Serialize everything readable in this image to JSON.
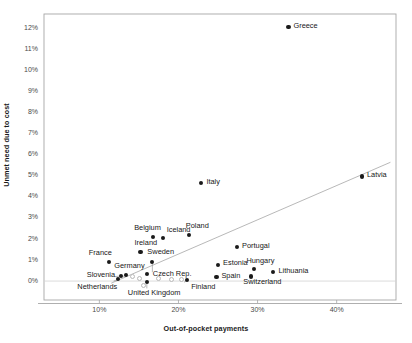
{
  "chart_data": {
    "type": "scatter",
    "title": "",
    "xlabel": "Out-of-pocket payments",
    "ylabel": "Unmet need due to cost",
    "xlim": [
      0.03,
      0.475
    ],
    "ylim": [
      -0.009,
      0.127
    ],
    "xticks": [
      "10%",
      "20%",
      "30%",
      "40%"
    ],
    "xtick_values": [
      0.1,
      0.2,
      0.3,
      0.4
    ],
    "yticks": [
      "0%",
      "1%",
      "2%",
      "3%",
      "4%",
      "5%",
      "6%",
      "7%",
      "8%",
      "9%",
      "10%",
      "11%",
      "12%"
    ],
    "ytick_values": [
      0.0,
      0.01,
      0.02,
      0.03,
      0.04,
      0.05,
      0.06,
      0.07,
      0.08,
      0.09,
      0.1,
      0.11,
      0.12
    ],
    "grid": false,
    "legend": "none",
    "zero_line": true,
    "trendline": {
      "label": "linear trend",
      "x_start": 0.115,
      "y_start": -0.001,
      "x_end": 0.468,
      "y_end": 0.0565
    },
    "points": [
      {
        "label": "Greece",
        "x": 0.339,
        "y": 0.1207,
        "label_dx": 5,
        "label_dy": -3.2,
        "marker": "filled"
      },
      {
        "label": "Latvia",
        "x": 0.432,
        "y": 0.0497,
        "label_dx": 5,
        "label_dy": -3.2,
        "marker": "filled"
      },
      {
        "label": "Italy",
        "x": 0.229,
        "y": 0.0466,
        "label_dx": 5,
        "label_dy": -3.2,
        "marker": "filled"
      },
      {
        "label": "Poland",
        "x": 0.213,
        "y": 0.0218,
        "label_dx": -3,
        "label_dy": -11,
        "marker": "filled"
      },
      {
        "label": "Belgium",
        "x": 0.168,
        "y": 0.0208,
        "label_dx": -19,
        "label_dy": -11,
        "marker": "filled"
      },
      {
        "label": "Iceland",
        "x": 0.18,
        "y": 0.0205,
        "label_dx": 4,
        "label_dy": -10,
        "marker": "filled"
      },
      {
        "label": "Portugal",
        "x": 0.274,
        "y": 0.0162,
        "label_dx": 5,
        "label_dy": -3.2,
        "marker": "filled"
      },
      {
        "label": "Ireland",
        "x": 0.152,
        "y": 0.0137,
        "label_dx": -6,
        "label_dy": -11,
        "marker": "filled"
      },
      {
        "label": "France",
        "x": 0.112,
        "y": 0.009,
        "label_dx": -20,
        "label_dy": -11,
        "marker": "filled"
      },
      {
        "label": "Sweden",
        "x": 0.167,
        "y": 0.0091,
        "label_dx": -5,
        "label_dy": -12,
        "marker": "filled"
      },
      {
        "label": "Estonia",
        "x": 0.25,
        "y": 0.0078,
        "label_dx": 5,
        "label_dy": -3.2,
        "marker": "filled"
      },
      {
        "label": "Hungary",
        "x": 0.296,
        "y": 0.0058,
        "label_dx": -8,
        "label_dy": -10,
        "marker": "filled"
      },
      {
        "label": "Lithuania",
        "x": 0.32,
        "y": 0.0044,
        "label_dx": 5,
        "label_dy": -3.2,
        "marker": "filled"
      },
      {
        "label": "Spain",
        "x": 0.248,
        "y": 0.002,
        "label_dx": 5,
        "label_dy": -3.2,
        "marker": "filled"
      },
      {
        "label": "Switzerland",
        "x": 0.292,
        "y": 0.0022,
        "label_dx": -8,
        "label_dy": 4,
        "marker": "filled"
      },
      {
        "label": "Germany",
        "x": 0.134,
        "y": 0.003,
        "label_dx": -12,
        "label_dy": -11,
        "marker": "filled"
      },
      {
        "label": "Czech Rep.",
        "x": 0.16,
        "y": 0.0033,
        "label_dx": 6,
        "label_dy": -2,
        "marker": "filled"
      },
      {
        "label": "Slovenia",
        "x": 0.127,
        "y": 0.0024,
        "label_dx": -34,
        "label_dy": -3,
        "marker": "filled"
      },
      {
        "label": "Netherlands",
        "x": 0.124,
        "y": 0.0008,
        "label_dx": -41,
        "label_dy": 6,
        "marker": "filled"
      },
      {
        "label": "United Kingdom",
        "x": 0.16,
        "y": -0.0004,
        "label_dx": -19,
        "label_dy": 9,
        "marker": "filled"
      },
      {
        "label": "Finland",
        "x": 0.211,
        "y": 0.0006,
        "label_dx": 4,
        "label_dy": 5,
        "marker": "filled"
      },
      {
        "label": "",
        "x": 0.141,
        "y": 0.0025,
        "label_dx": 0,
        "label_dy": 0,
        "marker": "hollow"
      },
      {
        "label": "",
        "x": 0.149,
        "y": 0.0017,
        "label_dx": 0,
        "label_dy": 0,
        "marker": "hollow"
      },
      {
        "label": "",
        "x": 0.174,
        "y": 0.0017,
        "label_dx": 0,
        "label_dy": 0,
        "marker": "hollow"
      },
      {
        "label": "",
        "x": 0.19,
        "y": 0.0013,
        "label_dx": 0,
        "label_dy": 0,
        "marker": "hollow"
      },
      {
        "label": "",
        "x": 0.203,
        "y": 0.0011,
        "label_dx": 0,
        "label_dy": 0,
        "marker": "hollow"
      },
      {
        "label": "",
        "x": 0.155,
        "y": -0.0018,
        "label_dx": 0,
        "label_dy": 0,
        "marker": "hollow"
      }
    ]
  },
  "colors": {
    "marker": "#1a1a1a",
    "frame": "#a6a6a6",
    "trendline": "#a6a6a6",
    "zero_line": "#d0d0d0",
    "text": "#171717",
    "tick_text": "#4a4a4a",
    "background": "#ffffff"
  },
  "axes": {
    "x_title": "Out-of-pocket payments",
    "y_title": "Unmet need due to cost"
  }
}
